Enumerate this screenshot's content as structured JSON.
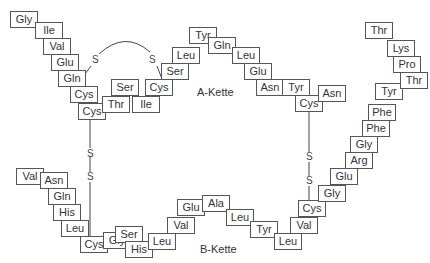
{
  "chain_labels": {
    "a": "A-Kette",
    "b": "B-Kette"
  },
  "sulfur": "S",
  "a_chain": [
    {
      "aa": "Gly",
      "x": 10,
      "y": 11
    },
    {
      "aa": "Ile",
      "x": 35,
      "y": 22
    },
    {
      "aa": "Val",
      "x": 43,
      "y": 38
    },
    {
      "aa": "Glu",
      "x": 51,
      "y": 54
    },
    {
      "aa": "Gln",
      "x": 58,
      "y": 70
    },
    {
      "aa": "Cys",
      "x": 70,
      "y": 86
    },
    {
      "aa": "Cys",
      "x": 78,
      "y": 103
    },
    {
      "aa": "Thr",
      "x": 102,
      "y": 96
    },
    {
      "aa": "Ser",
      "x": 111,
      "y": 79
    },
    {
      "aa": "Ile",
      "x": 132,
      "y": 96
    },
    {
      "aa": "Cys",
      "x": 145,
      "y": 79
    },
    {
      "aa": "Ser",
      "x": 161,
      "y": 63
    },
    {
      "aa": "Leu",
      "x": 172,
      "y": 47
    },
    {
      "aa": "Tyr",
      "x": 189,
      "y": 27
    },
    {
      "aa": "Gln",
      "x": 208,
      "y": 37
    },
    {
      "aa": "Leu",
      "x": 232,
      "y": 47
    },
    {
      "aa": "Glu",
      "x": 244,
      "y": 63
    },
    {
      "aa": "Asn",
      "x": 256,
      "y": 79
    },
    {
      "aa": "Tyr",
      "x": 282,
      "y": 79
    },
    {
      "aa": "Cys",
      "x": 295,
      "y": 95
    },
    {
      "aa": "Asn",
      "x": 318,
      "y": 85
    }
  ],
  "b_chain": [
    {
      "aa": "Val",
      "x": 16,
      "y": 168
    },
    {
      "aa": "Asn",
      "x": 40,
      "y": 172
    },
    {
      "aa": "Gln",
      "x": 48,
      "y": 188
    },
    {
      "aa": "His",
      "x": 53,
      "y": 204
    },
    {
      "aa": "Leu",
      "x": 61,
      "y": 220
    },
    {
      "aa": "Cys",
      "x": 80,
      "y": 236
    },
    {
      "aa": "Gly",
      "x": 103,
      "y": 232
    },
    {
      "aa": "Ser",
      "x": 115,
      "y": 226
    },
    {
      "aa": "His",
      "x": 125,
      "y": 241
    },
    {
      "aa": "Leu",
      "x": 148,
      "y": 233
    },
    {
      "aa": "Val",
      "x": 167,
      "y": 217
    },
    {
      "aa": "Glu",
      "x": 177,
      "y": 199
    },
    {
      "aa": "Ala",
      "x": 202,
      "y": 195
    },
    {
      "aa": "Leu",
      "x": 226,
      "y": 209
    },
    {
      "aa": "Tyr",
      "x": 250,
      "y": 221
    },
    {
      "aa": "Leu",
      "x": 274,
      "y": 233
    },
    {
      "aa": "Val",
      "x": 290,
      "y": 217
    },
    {
      "aa": "Cys",
      "x": 298,
      "y": 200
    },
    {
      "aa": "Gly",
      "x": 318,
      "y": 185
    },
    {
      "aa": "Glu",
      "x": 330,
      "y": 168
    },
    {
      "aa": "Arg",
      "x": 345,
      "y": 152
    },
    {
      "aa": "Gly",
      "x": 350,
      "y": 136
    },
    {
      "aa": "Phe",
      "x": 362,
      "y": 120
    },
    {
      "aa": "Phe",
      "x": 368,
      "y": 104
    },
    {
      "aa": "Tyr",
      "x": 375,
      "y": 83
    },
    {
      "aa": "Thr",
      "x": 400,
      "y": 72
    },
    {
      "aa": "Pro",
      "x": 393,
      "y": 56
    },
    {
      "aa": "Lys",
      "x": 387,
      "y": 40
    },
    {
      "aa": "Thr",
      "x": 365,
      "y": 22
    }
  ]
}
